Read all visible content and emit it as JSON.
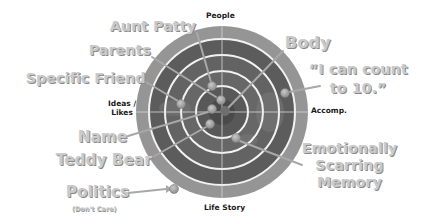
{
  "diagram": {
    "type": "target-rings",
    "center": {
      "x": 222,
      "y": 112
    },
    "rings": [
      {
        "r": 85,
        "color": "#8f8f8f"
      },
      {
        "r": 72,
        "color": "#5e5e5e"
      },
      {
        "r": 56,
        "color": "#666666"
      },
      {
        "r": 40,
        "color": "#6a6a6a"
      },
      {
        "r": 25,
        "color": "#5a5a5a"
      },
      {
        "r": 12,
        "color": "#4a4a4a"
      }
    ],
    "ring_stroke_color": "#f4f4f4",
    "crosshair_color": "#d8d8d8",
    "axes": {
      "top": "People",
      "bottom": "Life Story",
      "left_line1": "Ideas /",
      "left_line2": "Likes",
      "right": "Accomp."
    },
    "items": [
      {
        "label": "Aunt Patty",
        "dot": {
          "x": 212,
          "y": 86
        }
      },
      {
        "label": "Parents",
        "dot": {
          "x": 220,
          "y": 100
        }
      },
      {
        "label": "Specific Friend",
        "dot": {
          "x": 182,
          "y": 104
        }
      },
      {
        "label": "Body",
        "dot": {
          "x": 224,
          "y": 112
        }
      },
      {
        "label": "“I can count to 10.”",
        "line1": "“I can count",
        "line2": "to 10.”",
        "dot": {
          "x": 285,
          "y": 93
        }
      },
      {
        "label": "Name",
        "dot": {
          "x": 213,
          "y": 110
        }
      },
      {
        "label": "Teddy Bear",
        "dot": {
          "x": 210,
          "y": 124
        }
      },
      {
        "label": "Emotionally Scarring Memory",
        "line1": "Emotionally",
        "line2": "Scarring",
        "line3": "Memory",
        "dot": {
          "x": 235,
          "y": 138
        }
      },
      {
        "label": "Politics",
        "note": "(Don't Care)",
        "dot": {
          "x": 174,
          "y": 189
        }
      }
    ]
  }
}
